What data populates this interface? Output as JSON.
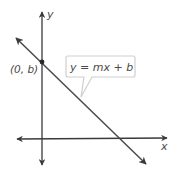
{
  "axes": {
    "x_label": "x",
    "y_label": "y"
  },
  "point": {
    "label": "(0, b)"
  },
  "line": {
    "equation": "y = mx + b"
  },
  "colors": {
    "axis": "#3a3a3a",
    "line": "#4a4a4a",
    "callout_border": "#cfcfcf",
    "text": "#4a4a4a"
  }
}
